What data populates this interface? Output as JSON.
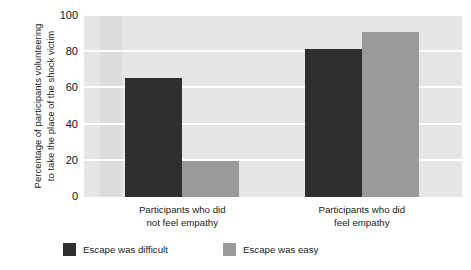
{
  "chart_data": {
    "type": "bar",
    "title": "",
    "xlabel": "",
    "ylabel": "Percentage of participants volunteering to take the place of the shock victim",
    "ylabel_line1": "Percentage of participants volunteering",
    "ylabel_line2": "to take the place of the shock victim",
    "categories": [
      "Participants who did not feel empathy",
      "Participants who did feel empathy"
    ],
    "category_lines": [
      [
        "Participants who did",
        "not feel empathy"
      ],
      [
        "Participants who did",
        "feel empathy"
      ]
    ],
    "series": [
      {
        "name": "Escape was difficult",
        "color": "#2f2f2f",
        "values": [
          66,
          82
        ]
      },
      {
        "name": "Escape was easy",
        "color": "#9a9a9a",
        "values": [
          20,
          91
        ]
      }
    ],
    "ylim": [
      0,
      100
    ],
    "yticks": [
      0,
      20,
      40,
      60,
      80,
      100
    ],
    "ytick_labels": [
      "0",
      "20",
      "40",
      "60",
      "80",
      "100"
    ],
    "grid": true,
    "grid_color": "#ffffff",
    "plot_background": "#e3e3e3",
    "legend_position": "bottom"
  },
  "legend": {
    "items": [
      {
        "label": "Escape was difficult",
        "color": "#2f2f2f"
      },
      {
        "label": "Escape was easy",
        "color": "#9a9a9a"
      }
    ]
  }
}
